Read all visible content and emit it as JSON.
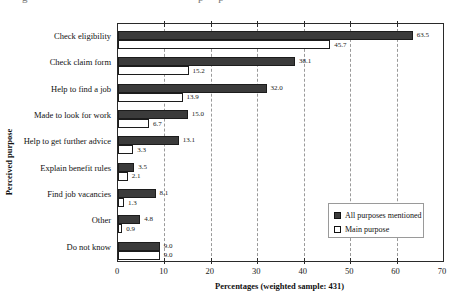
{
  "figure": {
    "clipped_caption_fragments": {
      "frag1": "g",
      "frag2": "p p"
    }
  },
  "chart_data": {
    "type": "bar",
    "orientation": "horizontal",
    "title": "",
    "categories": [
      "Check eligibility",
      "Check claim form",
      "Help to find a job",
      "Made to look for work",
      "Help to get further advice",
      "Explain benefit rules",
      "Find job vacancies",
      "Other",
      "Do not know"
    ],
    "series": [
      {
        "name": "All purposes mentioned",
        "style": "filled",
        "color": "#3b3b3b",
        "values": [
          63.5,
          38.1,
          32.0,
          15.0,
          13.1,
          3.5,
          8.1,
          4.8,
          9.0
        ]
      },
      {
        "name": "Main purpose",
        "style": "outlined",
        "color": "#ffffff",
        "values": [
          45.7,
          15.2,
          13.9,
          6.7,
          3.3,
          2.1,
          1.3,
          0.9,
          9.0
        ]
      }
    ],
    "xlabel": "Percentages (weighted sample: 431)",
    "ylabel": "Perceived purpose",
    "xlim": [
      0,
      70
    ],
    "xticks": [
      0,
      10,
      20,
      30,
      40,
      50,
      60,
      70
    ],
    "grid": "dashed-vertical",
    "value_labels": true,
    "legend_position": "inside-lower-right"
  }
}
